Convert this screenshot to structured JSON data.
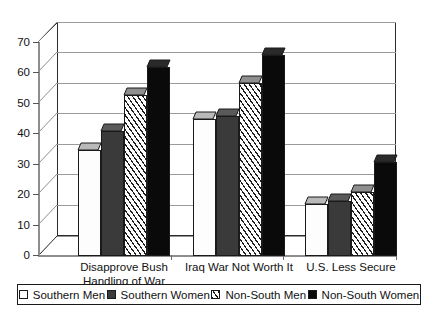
{
  "chart_data": {
    "type": "bar",
    "title": "",
    "subtitle": "",
    "xlabel": "",
    "ylabel": "",
    "ylim": [
      0,
      70
    ],
    "yticks": [
      0,
      10,
      20,
      30,
      40,
      50,
      60,
      70
    ],
    "ytick_labels": [
      "0",
      "10",
      "20",
      "30",
      "40",
      "50",
      "60",
      "70"
    ],
    "grid": true,
    "legend_position": "bottom",
    "style": "3d-column",
    "categories": [
      "Disapprove  Bush\nHandling of War",
      "Iraq War Not Worth It",
      "U.S. Less Secure"
    ],
    "series": [
      {
        "name": "Southern Men",
        "values": [
          35,
          45,
          17
        ],
        "fill": "dots",
        "color": "#fdfdfd"
      },
      {
        "name": "Southern Women",
        "values": [
          41,
          46,
          18
        ],
        "fill": "solid-dk",
        "color": "#3a3a3a"
      },
      {
        "name": "Non-South Men",
        "values": [
          53,
          57,
          21
        ],
        "fill": "hatch",
        "color": "#ffffff"
      },
      {
        "name": "Non-South Women",
        "values": [
          62,
          66,
          31
        ],
        "fill": "black",
        "color": "#0a0a0a"
      }
    ]
  },
  "legend": {
    "items": [
      {
        "label": "Southern Men",
        "swatch": "dots"
      },
      {
        "label": "Southern Women",
        "swatch": "solid-dk"
      },
      {
        "label": "Non-South Men",
        "swatch": "hatch"
      },
      {
        "label": "Non-South Women",
        "swatch": "black"
      }
    ]
  },
  "axis": {
    "y_labels": [
      "70",
      "60",
      "50",
      "40",
      "30",
      "20",
      "10",
      "0"
    ]
  },
  "categories_display": [
    {
      "line1": "Disapprove  Bush",
      "line2": "Handling of War"
    },
    {
      "line1": "Iraq War Not Worth It",
      "line2": ""
    },
    {
      "line1": "U.S. Less Secure",
      "line2": ""
    }
  ]
}
